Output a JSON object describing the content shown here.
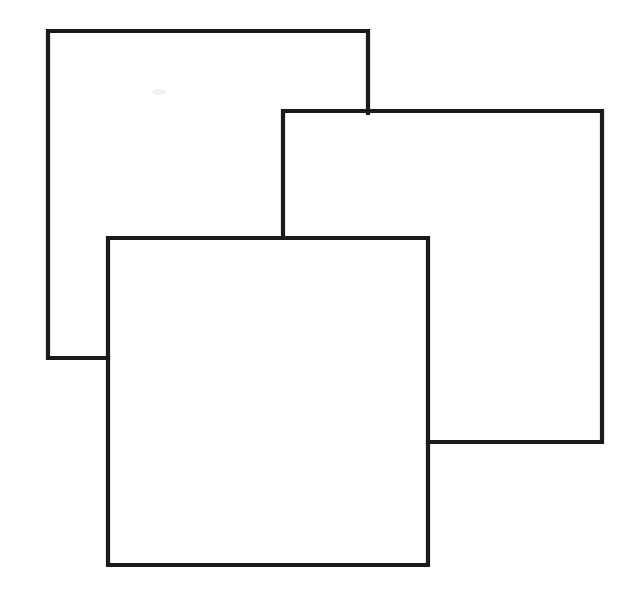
{
  "figure": {
    "title": "Three Overlapping Squares",
    "background_color": "#ffffff",
    "stroke_color": "#1a1a1a",
    "stroke_width": 4.2,
    "canvas": {
      "width": 627,
      "height": 596
    },
    "style": "line-drawing",
    "occlusion_order": [
      "back-square",
      "middle-square",
      "front-square"
    ],
    "caption": ""
  },
  "shapes": [
    {
      "id": "back-square",
      "name": "back square",
      "z_index": 1,
      "x": 48,
      "y": 31,
      "width": 320,
      "height": 327,
      "right": 368,
      "bottom": 358,
      "outline_path": "M 368 113 L 368 31 L 48 31 L 48 358 L 108 358",
      "occluded_by": [
        "middle-square",
        "front-square"
      ],
      "visible_edges": [
        "top",
        "left",
        "partial-right",
        "partial-bottom"
      ]
    },
    {
      "id": "middle-square",
      "name": "middle square",
      "z_index": 2,
      "x": 283,
      "y": 111,
      "width": 319,
      "height": 331,
      "right": 602,
      "bottom": 442,
      "outline_path": "M 283 238 L 283 111 L 602 111 L 602 442 L 428 442",
      "occluded_by": [
        "front-square"
      ],
      "visible_edges": [
        "top",
        "right",
        "partial-left",
        "partial-bottom"
      ]
    },
    {
      "id": "front-square",
      "name": "front square",
      "z_index": 3,
      "x": 108,
      "y": 238,
      "width": 320,
      "height": 327,
      "right": 428,
      "bottom": 565,
      "outline_path": "M 108 238 L 428 238 L 428 565 L 108 565 Z",
      "occluded_by": [],
      "visible_edges": [
        "top",
        "right",
        "bottom",
        "left"
      ]
    }
  ],
  "artifacts": [
    {
      "id": "scan-smudge",
      "name": "faint scan smudge",
      "x": 152,
      "y": 89,
      "width": 14,
      "height": 6
    }
  ]
}
